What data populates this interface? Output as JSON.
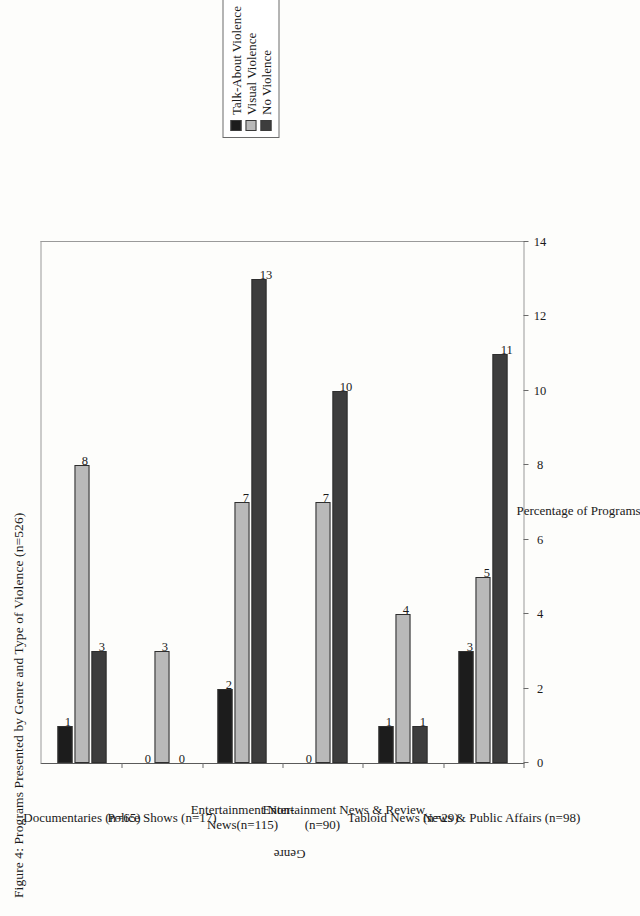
{
  "figure": {
    "title": "Figure 4: Programs Presented by Genre and Type of Violence (n=526)",
    "genre_axis_title": "Genre",
    "percentage_axis_title": "Percentage of Programs"
  },
  "legend": {
    "items": [
      {
        "label": "Talk-About Violence",
        "color": "#1c1c1c"
      },
      {
        "label": "Visual Violence",
        "color": "#b9b9b9"
      },
      {
        "label": "No Violence",
        "color": "#3d3d3d"
      }
    ]
  },
  "chart_data": {
    "type": "bar",
    "title": "Figure 4: Programs Presented by Genre and Type of Violence (n=526)",
    "xlabel": "Genre",
    "ylabel": "Percentage of Programs",
    "ylim": [
      0,
      14
    ],
    "yticks": [
      "0",
      "2",
      "4",
      "6",
      "8",
      "10",
      "12",
      "14"
    ],
    "grid": false,
    "legend_position": "top-right",
    "orientation": "vertical",
    "categories": [
      "Documentaries (n=65)",
      "Police Shows (n=17)",
      "Entertainment Non-\nNews(n=115)",
      "Entertainment News & Review\n(n=90)",
      "Tabloid News (n=29)",
      "News & Public Affairs (n=98)"
    ],
    "series": [
      {
        "name": "Talk-About Violence",
        "color": "#1c1c1c",
        "values": [
          1,
          0,
          2,
          0,
          1,
          3
        ]
      },
      {
        "name": "Visual Violence",
        "color": "#b9b9b9",
        "values": [
          8,
          3,
          7,
          7,
          4,
          5
        ]
      },
      {
        "name": "No Violence",
        "color": "#3d3d3d",
        "values": [
          3,
          0,
          13,
          10,
          1,
          11
        ]
      }
    ],
    "value_labels": [
      [
        "1",
        "8",
        "3"
      ],
      [
        "0",
        "3",
        "0"
      ],
      [
        "2",
        "7",
        "13"
      ],
      [
        "0",
        "7",
        "10"
      ],
      [
        "1",
        "4",
        "1"
      ],
      [
        "3",
        "5",
        "11"
      ]
    ]
  }
}
